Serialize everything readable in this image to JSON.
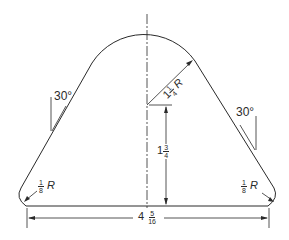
{
  "drawing": {
    "colors": {
      "line": "#2a2a2a",
      "background": "#ffffff"
    },
    "dimensions": {
      "top_radius": {
        "whole": "1",
        "num": "1",
        "den": "4",
        "suffix": "R"
      },
      "height": {
        "whole": "1",
        "num": "3",
        "den": "4"
      },
      "base_width": {
        "whole": "4",
        "num": "5",
        "den": "16"
      },
      "left_corner_radius": {
        "num": "1",
        "den": "8",
        "suffix": "R"
      },
      "right_corner_radius": {
        "num": "1",
        "den": "8",
        "suffix": "R"
      },
      "left_angle": "30°",
      "right_angle": "30°"
    }
  }
}
